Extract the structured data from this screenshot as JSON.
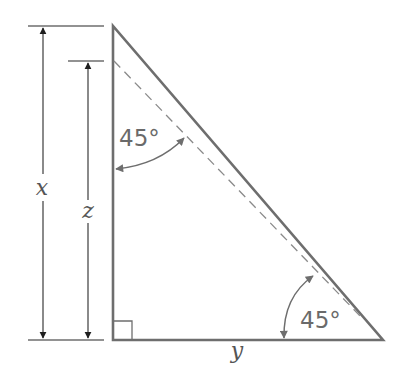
{
  "figure": {
    "type": "right-triangle-diagram",
    "colors": {
      "triangle_stroke": "#6e6e6e",
      "dimension_stroke": "#3c3c3c",
      "dashed_stroke": "#8a8a8a",
      "arc_stroke": "#6e6e6e",
      "label": "#555555"
    },
    "labels": {
      "x": "x",
      "z": "z",
      "y": "y",
      "angle_top": "45°",
      "angle_bottom": "45°"
    },
    "elements": [
      "vertical dimension arrow x spanning full height of triangle",
      "vertical dimension arrow z spanning from dashed-line start to base",
      "right-angle marker at bottom-left vertex",
      "dashed line parallel to hypotenuse",
      "45° angle arc between vertical leg and dashed line",
      "45° angle arc between base and hypotenuse"
    ]
  }
}
